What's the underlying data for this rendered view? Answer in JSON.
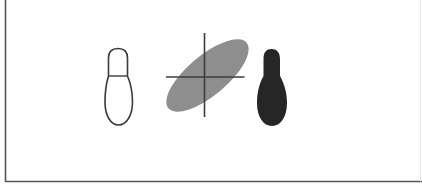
{
  "figure": {
    "background": "#ffffff",
    "border_color": "#555555",
    "border_faint_color": "#e4e4e4",
    "shapes": [
      {
        "id": "outline-pin",
        "kind": "outlined bowling-pin / bottle silhouette",
        "stroke": "#3a3a3a",
        "fill": "none"
      },
      {
        "id": "tilted-ellipse-with-crosshair",
        "kind": "gray tilted ellipse with crosshair axes",
        "fill": "#8e8e8e",
        "axis_color": "#3c3c3c"
      },
      {
        "id": "filled-pin",
        "kind": "solid dark bowling-pin / bottle silhouette",
        "fill": "#262626"
      }
    ]
  }
}
